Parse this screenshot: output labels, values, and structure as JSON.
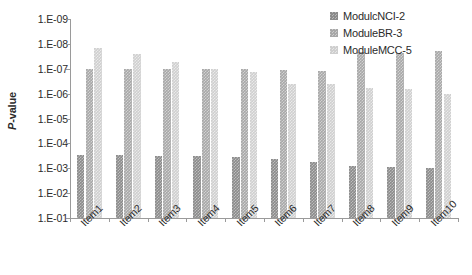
{
  "chart_data": {
    "type": "bar",
    "title": "",
    "subtitle": "",
    "xlabel": "",
    "ylabel": "P-value",
    "ylabel_parts": {
      "italic": "P",
      "rest": "-value"
    },
    "scale": "log-inverted",
    "ylim": [
      1e-09,
      0.1
    ],
    "ytick_labels": [
      "1.E-09",
      "1.E-08",
      "1.E-07",
      "1.E-06",
      "1.E-05",
      "1.E-04",
      "1.E-03",
      "1.E-02",
      "1.E-01"
    ],
    "ytick_values": [
      1e-09,
      1e-08,
      1e-07,
      1e-06,
      1e-05,
      0.0001,
      0.001,
      0.01,
      0.1
    ],
    "grid": false,
    "legend_position": "top-right",
    "categories": [
      "Item1",
      "Item2",
      "Item3",
      "Item4",
      "Item5",
      "Item6",
      "Item7",
      "Item8",
      "Item9",
      "Item10"
    ],
    "series": [
      {
        "name": "ModulcNCI-2",
        "color": "#8b8b8b",
        "values": [
          0.0003,
          0.0003,
          0.00032,
          0.00033,
          0.00036,
          0.00042,
          0.00055,
          0.0008,
          0.00085,
          0.001
        ]
      },
      {
        "name": "ModuleBR-3",
        "color": "#a8a8a8",
        "values": [
          1e-07,
          1e-07,
          1e-07,
          1e-07,
          1.05e-07,
          1.1e-07,
          1.2e-07,
          2.2e-08,
          2.4e-08,
          1.9e-08
        ]
      },
      {
        "name": "ModuleMCC-5",
        "color": "#cfcfcf",
        "values": [
          1.5e-08,
          2.6e-08,
          5.5e-08,
          1e-07,
          1.3e-07,
          4e-07,
          4e-07,
          6e-07,
          6.5e-07,
          1e-06
        ]
      }
    ]
  },
  "legend": {
    "items": [
      {
        "label": "ModulcNCI-2"
      },
      {
        "label": "ModuleBR-3"
      },
      {
        "label": "ModuleMCC-5"
      }
    ]
  }
}
